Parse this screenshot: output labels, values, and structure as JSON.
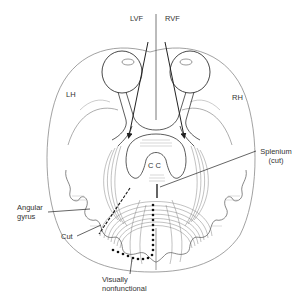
{
  "figure": {
    "labels": {
      "lvf": "LVF",
      "rvf": "RVF",
      "lh": "LH",
      "rh": "RH",
      "cc": "C C",
      "splenium_line1": "Splenium",
      "splenium_line2": "(cut)",
      "angular_line1": "Angular",
      "angular_line2": "gyrus",
      "cut": "Cut",
      "visually_line1": "Visually",
      "visually_line2": "nonfunctional"
    },
    "colors": {
      "line": "#333333",
      "light_line": "#8a8a8a",
      "background": "#ffffff"
    }
  }
}
